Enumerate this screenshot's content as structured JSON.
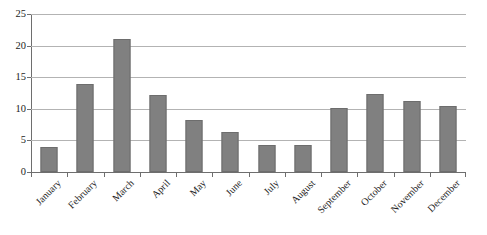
{
  "chart_data": {
    "type": "bar",
    "title": "",
    "subtitle": "",
    "xlabel": "",
    "ylabel": "",
    "ylim": [
      0,
      25
    ],
    "yticks": [
      0,
      5,
      10,
      15,
      20,
      25
    ],
    "ytick_labels": [
      "0",
      "5",
      "10",
      "15",
      "20",
      "25"
    ],
    "grid": "horizontal",
    "legend": "none",
    "categories": [
      "January",
      "February",
      "March",
      "April",
      "May",
      "June",
      "July",
      "August",
      "September",
      "October",
      "November",
      "December"
    ],
    "values": [
      4,
      14,
      21,
      12.2,
      8.2,
      6.3,
      4.2,
      4.2,
      10.2,
      12.3,
      11.3,
      10.4
    ],
    "series": [
      {
        "name": "",
        "values": [
          4,
          14,
          21,
          12.2,
          8.2,
          6.3,
          4.2,
          4.2,
          10.2,
          12.3,
          11.3,
          10.4
        ]
      }
    ],
    "colors": {
      "bar_fill": "#808080",
      "bar_edge": "#6d6d6d",
      "gridline": "#b3b3b3",
      "axis": "#6e6e6e",
      "text": "#1c1c1c",
      "background": "#ffffff"
    }
  }
}
